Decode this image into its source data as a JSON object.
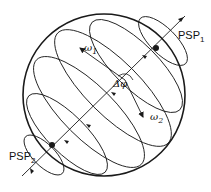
{
  "diagram": {
    "type": "poincare-sphere",
    "labels": {
      "psp1": {
        "main": "PSP",
        "sub": "1"
      },
      "psp2": {
        "main": "PSP",
        "sub": "2"
      },
      "omega1": {
        "main": "ω",
        "sub": "1"
      },
      "omega2": {
        "main": "ω",
        "sub": "2"
      },
      "delta_phi": "Δφ"
    },
    "colors": {
      "stroke": "#1a1a1a",
      "background": "#ffffff"
    }
  }
}
